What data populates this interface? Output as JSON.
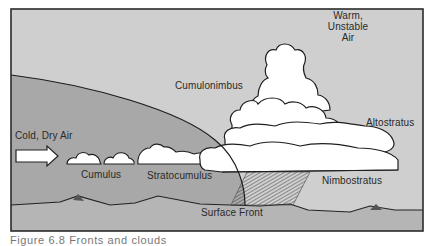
{
  "diagram": {
    "labels": {
      "warm_air": [
        "Warm,",
        "Unstable",
        "Air"
      ],
      "cumulonimbus": "Cumulonimbus",
      "altostratus": "Altostratus",
      "cold_air": "Cold, Dry Air",
      "cumulus": "Cumulus",
      "stratocumulus": "Stratocumulus",
      "nimbostratus": "Nimbostratus",
      "surface_front": "Surface Front"
    },
    "colors": {
      "warm_air_region": "#cdcdcd",
      "cold_air_region": "#a9a9a9",
      "ground": "#b4b4b4",
      "cloud_fill": "#ffffff",
      "outline": "#1e1e1e",
      "frame": "#2b2b2b"
    }
  },
  "caption": {
    "text": "Figure 6.8  Fronts and clouds"
  }
}
